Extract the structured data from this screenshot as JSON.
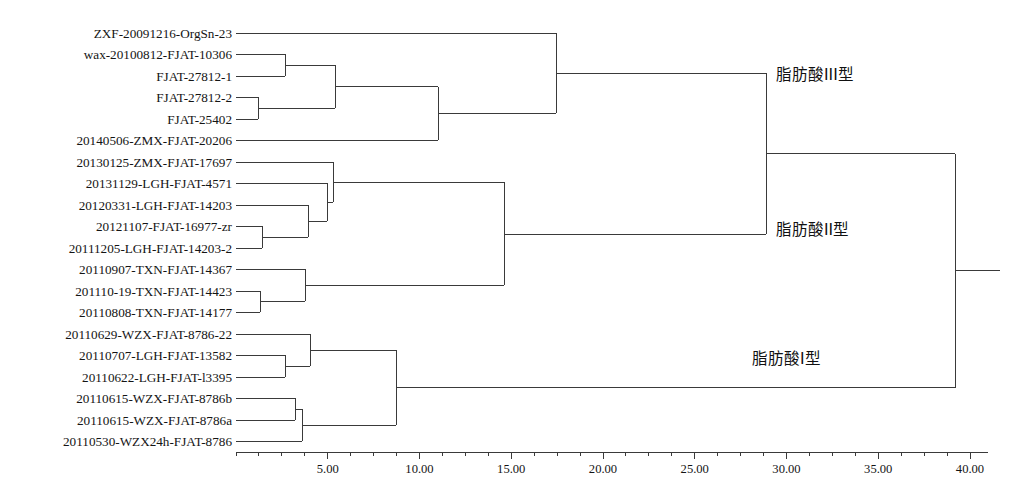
{
  "figure": {
    "type": "dendrogram",
    "title": "",
    "xlabel": "",
    "axis_orientation": "bottom"
  },
  "leaves": [
    {
      "label": "ZXF-20091216-OrgSn-23",
      "y": 33
    },
    {
      "label": "wax-20100812-FJAT-10306",
      "y": 54
    },
    {
      "label": "FJAT-27812-1",
      "y": 76
    },
    {
      "label": "FJAT-27812-2",
      "y": 97
    },
    {
      "label": "FJAT-25402",
      "y": 119
    },
    {
      "label": "20140506-ZMX-FJAT-20206",
      "y": 140
    },
    {
      "label": "20130125-ZMX-FJAT-17697",
      "y": 162
    },
    {
      "label": "20131129-LGH-FJAT-4571",
      "y": 183
    },
    {
      "label": "20120331-LGH-FJAT-14203",
      "y": 205
    },
    {
      "label": "20121107-FJAT-16977-zr",
      "y": 226
    },
    {
      "label": "20111205-LGH-FJAT-14203-2",
      "y": 248
    },
    {
      "label": "20110907-TXN-FJAT-14367",
      "y": 269
    },
    {
      "label": "201110-19-TXN-FJAT-14423",
      "y": 291
    },
    {
      "label": "20110808-TXN-FJAT-14177",
      "y": 312
    },
    {
      "label": "20110629-WZX-FJAT-8786-22",
      "y": 334
    },
    {
      "label": "20110707-LGH-FJAT-13582",
      "y": 355
    },
    {
      "label": "20110622-LGH-FJAT-l3395",
      "y": 377
    },
    {
      "label": "20110615-WZX-FJAT-8786b",
      "y": 398
    },
    {
      "label": "20110615-WZX-FJAT-8786a",
      "y": 420
    },
    {
      "label": "20110530-WZX24h-FJAT-8786",
      "y": 441
    }
  ],
  "cluster_labels": [
    {
      "name": "fatty-acid-type-3",
      "text": "脂肪酸III型",
      "x": 776,
      "y": 73
    },
    {
      "name": "fatty-acid-type-2",
      "text": "脂肪酸II型",
      "x": 776,
      "y": 228
    },
    {
      "name": "fatty-acid-type-1",
      "text": "脂肪酸I型",
      "x": 752,
      "y": 357
    }
  ],
  "axis": {
    "x_start_px": 236,
    "x_end_px": 988,
    "y_px": 452,
    "px_per_unit": 18.35,
    "tick_labels": [
      "5.00",
      "10.00",
      "15.00",
      "20.00",
      "25.00",
      "30.00",
      "35.00",
      "40.00"
    ],
    "tick_values": [
      5,
      10,
      15,
      20,
      25,
      30,
      35,
      40
    ],
    "minor_tick_step": 1.25,
    "range": [
      0,
      41
    ]
  },
  "chart_data": {
    "type": "dendrogram",
    "title": "",
    "xlabel": "",
    "ylabel": "",
    "xlim": [
      0,
      41
    ],
    "grid": false,
    "legend": "none",
    "linkage_merges": [
      {
        "id": "m1",
        "children": [
          "wax-20100812-FJAT-10306",
          "FJAT-27812-1"
        ],
        "distance": 2.7,
        "x_px": 285,
        "y_px": 65
      },
      {
        "id": "m2",
        "children": [
          "FJAT-27812-2",
          "FJAT-25402"
        ],
        "distance": 1.2,
        "x_px": 258,
        "y_px": 108
      },
      {
        "id": "m3",
        "children": [
          "m1",
          "m2"
        ],
        "distance": 5.4,
        "x_px": 335,
        "y_px": 86.5
      },
      {
        "id": "m4",
        "children": [
          "m3",
          "20140506-ZMX-FJAT-20206"
        ],
        "distance": 11.0,
        "x_px": 438,
        "y_px": 113
      },
      {
        "id": "m5",
        "children": [
          "ZXF-20091216-OrgSn-23",
          "m4"
        ],
        "distance": 17.4,
        "x_px": 556,
        "y_px": 73
      },
      {
        "id": "m6",
        "children": [
          "20121107-FJAT-16977-zr",
          "20111205-LGH-FJAT-14203-2"
        ],
        "distance": 1.4,
        "x_px": 262,
        "y_px": 237
      },
      {
        "id": "m7",
        "children": [
          "20120331-LGH-FJAT-14203",
          "m6"
        ],
        "distance": 4.0,
        "x_px": 308,
        "y_px": 221
      },
      {
        "id": "m8",
        "children": [
          "20131129-LGH-FJAT-4571",
          "m7"
        ],
        "distance": 5.0,
        "x_px": 327,
        "y_px": 202
      },
      {
        "id": "m9",
        "children": [
          "20130125-ZMX-FJAT-17697",
          "m8"
        ],
        "distance": 5.3,
        "x_px": 333,
        "y_px": 182
      },
      {
        "id": "m10",
        "children": [
          "201110-19-TXN-FJAT-14423",
          "20110808-TXN-FJAT-14177"
        ],
        "distance": 1.3,
        "x_px": 260,
        "y_px": 301
      },
      {
        "id": "m11",
        "children": [
          "20110907-TXN-FJAT-14367",
          "m10"
        ],
        "distance": 3.8,
        "x_px": 305,
        "y_px": 285
      },
      {
        "id": "m12",
        "children": [
          "m9",
          "m11"
        ],
        "distance": 14.9,
        "x_px": 504,
        "y_px": 234
      },
      {
        "id": "m13",
        "children": [
          "20110707-LGH-FJAT-13582",
          "20110622-LGH-FJAT-l3395"
        ],
        "distance": 2.7,
        "x_px": 285,
        "y_px": 366
      },
      {
        "id": "m14",
        "children": [
          "20110629-WZX-FJAT-8786-22",
          "m13"
        ],
        "distance": 4.0,
        "x_px": 310,
        "y_px": 350
      },
      {
        "id": "m15",
        "children": [
          "20110615-WZX-FJAT-8786b",
          "20110615-WZX-FJAT-8786a"
        ],
        "distance": 1.6,
        "x_px": 295,
        "y_px": 409
      },
      {
        "id": "m16",
        "children": [
          "m15",
          "20110530-WZX24h-FJAT-8786"
        ],
        "distance": 3.4,
        "x_px": 302,
        "y_px": 425
      },
      {
        "id": "m17",
        "children": [
          "m14",
          "m16"
        ],
        "distance": 8.7,
        "x_px": 396,
        "y_px": 387.5
      },
      {
        "id": "m18",
        "children": [
          "m5",
          "m12"
        ],
        "distance": 28.9,
        "x_px": 766,
        "y_px": 153.5
      },
      {
        "id": "m19",
        "children": [
          "m18",
          "m17"
        ],
        "distance": 39.2,
        "x_px": 955,
        "y_px": 270
      }
    ]
  }
}
